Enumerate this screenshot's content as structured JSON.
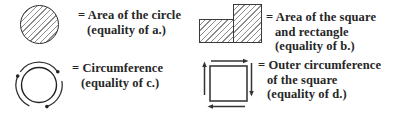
{
  "legend": {
    "items": [
      {
        "icon": "hatched-circle",
        "line1": "= Area of the circle",
        "line2": "(equality of a.)"
      },
      {
        "icon": "hatched-square-and-rectangle",
        "line1": "= Area of the square",
        "line2": "and rectangle",
        "line3": "(equality of b.)"
      },
      {
        "icon": "circle-with-rotation-arrows",
        "line1": "= Circumference",
        "line2": "(equality of c.)"
      },
      {
        "icon": "square-with-perimeter-arrows",
        "line1": "= Outer circumference",
        "line2": "of the square",
        "line3": "(equality of d.)"
      }
    ],
    "colors": {
      "background": "#ffffff",
      "outline": "#2e2e2e",
      "hatch": "#8d8d8d",
      "arrow": "#333333",
      "text": "#262626"
    }
  }
}
